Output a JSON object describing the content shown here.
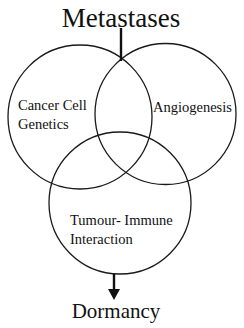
{
  "diagram": {
    "type": "venn",
    "top_label": "Metastases",
    "bottom_label": "Dormancy",
    "sets": [
      {
        "id": "cancer-cell-genetics",
        "line1": "Cancer Cell",
        "line2": "Genetics"
      },
      {
        "id": "angiogenesis",
        "line1": "Angiogenesis",
        "line2": ""
      },
      {
        "id": "tumour-immune-interaction",
        "line1": "Tumour- Immune",
        "line2": "Interaction"
      }
    ],
    "connections": [
      {
        "from": "intersection-top",
        "to": "Metastases",
        "style": "line"
      },
      {
        "from": "tumour-immune-interaction",
        "to": "Dormancy",
        "style": "arrow"
      }
    ],
    "colors": {
      "stroke": "#1a1a1a",
      "background": "#ffffff",
      "text": "#111111"
    }
  }
}
